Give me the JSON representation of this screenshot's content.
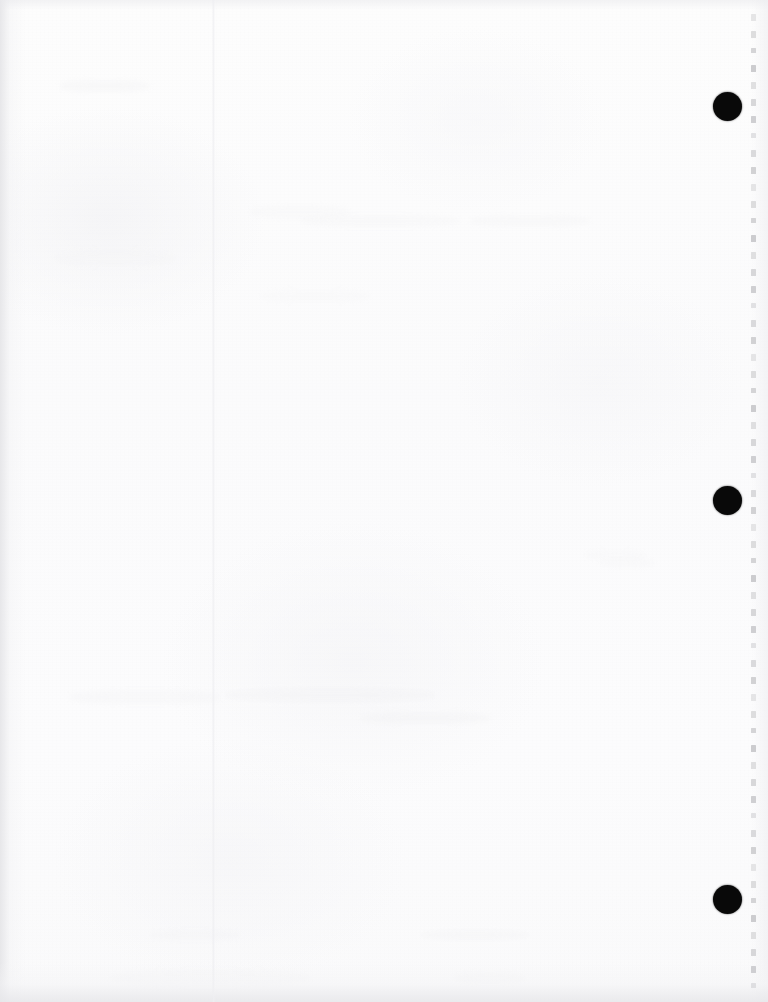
{
  "document": {
    "kind": "scanned-page",
    "title": "Scanned Blank Page",
    "orientation": "portrait",
    "page_width_px": 768,
    "page_height_px": 1002,
    "visible_text": "",
    "text_note": "No legible text is present on this scanned page."
  },
  "colors": {
    "page_background": "#fcfcfc",
    "canvas_background": "#fdfdfd",
    "hole_punch": "#090909",
    "tick_mark": "#c9c9cc",
    "crease": "#eeeef1",
    "edge_shadow": "#e7e7ea"
  },
  "hole_punches": [
    {
      "name": "hole-punch-top",
      "cx": 727,
      "cy": 106,
      "diameter": 29
    },
    {
      "name": "hole-punch-middle",
      "cx": 727,
      "cy": 500,
      "diameter": 29
    },
    {
      "name": "hole-punch-bottom",
      "cx": 727,
      "cy": 899,
      "diameter": 29
    }
  ],
  "tick_column": {
    "name": "perforation-tick-column",
    "x": 750,
    "start_y": 14,
    "spacing": 17,
    "count": 58,
    "tick_height": 7
  },
  "fold_crease": {
    "name": "vertical-fold-crease",
    "x": 212,
    "width": 3
  },
  "ghost_smudges": [
    {
      "x": 55,
      "y": 250,
      "w": 120,
      "h": 16
    },
    {
      "x": 250,
      "y": 205,
      "w": 100,
      "h": 14
    },
    {
      "x": 300,
      "y": 215,
      "w": 160,
      "h": 12
    },
    {
      "x": 470,
      "y": 215,
      "w": 120,
      "h": 12
    },
    {
      "x": 70,
      "y": 690,
      "w": 150,
      "h": 14
    },
    {
      "x": 225,
      "y": 688,
      "w": 210,
      "h": 14
    },
    {
      "x": 360,
      "y": 712,
      "w": 130,
      "h": 12
    },
    {
      "x": 585,
      "y": 550,
      "w": 60,
      "h": 10
    },
    {
      "x": 600,
      "y": 558,
      "w": 55,
      "h": 10
    },
    {
      "x": 110,
      "y": 970,
      "w": 200,
      "h": 16
    },
    {
      "x": 455,
      "y": 972,
      "w": 70,
      "h": 12
    },
    {
      "x": 150,
      "y": 930,
      "w": 90,
      "h": 10
    },
    {
      "x": 420,
      "y": 930,
      "w": 110,
      "h": 10
    },
    {
      "x": 60,
      "y": 80,
      "w": 90,
      "h": 12
    },
    {
      "x": 260,
      "y": 290,
      "w": 110,
      "h": 12
    }
  ]
}
